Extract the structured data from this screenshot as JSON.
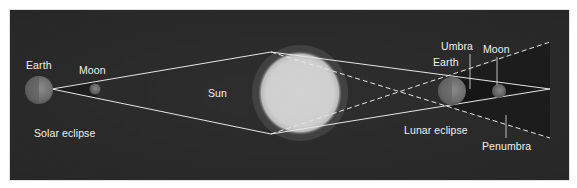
{
  "diagram": {
    "colors": {
      "background": "#2a2a2a",
      "lines": "#e6e6e6",
      "text": "#f0f0f0",
      "sun": "#d8d8d8"
    },
    "solar_eclipse": {
      "earth_label": "Earth",
      "moon_label": "Moon",
      "caption": "Solar eclipse"
    },
    "sun": {
      "label": "Sun"
    },
    "lunar_eclipse": {
      "earth_label": "Earth",
      "moon_label": "Moon",
      "umbra_label": "Umbra",
      "penumbra_label": "Penumbra",
      "caption": "Lunar eclipse"
    }
  }
}
